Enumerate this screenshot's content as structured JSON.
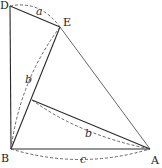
{
  "points": {
    "D": {
      "label": "D",
      "x": 10,
      "y": 6
    },
    "E": {
      "label": "E",
      "x": 60,
      "y": 27
    },
    "B": {
      "label": "B",
      "x": 11,
      "y": 149
    },
    "A": {
      "label": "A",
      "x": 150,
      "y": 149
    },
    "F": {
      "label": "",
      "x": 32,
      "y": 100
    }
  },
  "point_labels": {
    "D": {
      "text": "D",
      "x": 0,
      "y": 9
    },
    "E": {
      "text": "E",
      "x": 63,
      "y": 26
    },
    "B": {
      "text": "B",
      "x": 1,
      "y": 162
    },
    "A": {
      "text": "A",
      "x": 151,
      "y": 164
    }
  },
  "segment_labels": {
    "a": {
      "text": "a",
      "x": 36,
      "y": 15
    },
    "b_left": {
      "text": "b",
      "x": 25,
      "y": 83
    },
    "b_inner": {
      "text": "b",
      "x": 85,
      "y": 137
    },
    "c": {
      "text": "c",
      "x": 80,
      "y": 163
    }
  },
  "colors": {
    "line": "#2a2a2a",
    "dashed": "#555555",
    "background": "#ffffff"
  }
}
